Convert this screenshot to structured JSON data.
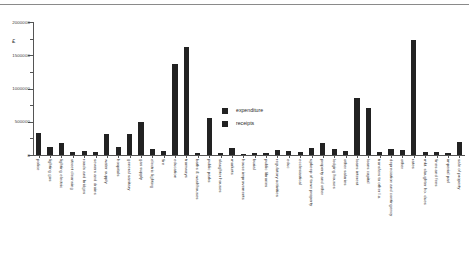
{
  "chart_data": {
    "type": "bar",
    "title": "",
    "xlabel": "",
    "ylabel": "£",
    "ylim": [
      0,
      2000000
    ],
    "ytick_labels": [
      "0",
      "500000",
      "1000000",
      "1500000",
      "2000000"
    ],
    "ytick_values": [
      0,
      500000,
      1000000,
      1500000,
      2000000
    ],
    "minor_ticks": [
      250000,
      750000,
      1250000,
      1750000
    ],
    "grid": false,
    "legend_position": "center",
    "legend": [
      "expenditure",
      "receipts"
    ],
    "categories": [
      "police",
      "lighting gas",
      "lighting electric",
      "street cleansing",
      "roads and bridges",
      "sewers and drains",
      "water supply",
      "hospitals",
      "general sanitary",
      "gas supply",
      "electric lighting",
      "fire",
      "education",
      "tramways",
      "baths & washhouses",
      "public parks",
      "slaughter houses",
      "markets",
      "house improvements",
      "burial",
      "public libraries",
      "regulatory activities",
      "educ",
      "ecclesiastical",
      "upkeep of town property",
      "property and other",
      "lodging houses",
      "other salaries",
      "loans interest",
      "loans capital",
      "transfers to other l.a.",
      "depreciation and contingency",
      "other",
      "rates",
      "mkt. slaughter ho. dues",
      "fines and fees",
      "imperial parl",
      "sale of property"
    ],
    "series": [
      {
        "name": "expenditure",
        "values": [
          330000,
          0,
          185000,
          0,
          60000,
          40000,
          310000,
          0,
          315000,
          0,
          90000,
          65000,
          1370000,
          0,
          35000,
          0,
          30000,
          0,
          20000,
          25000,
          35000,
          0,
          0,
          0,
          0,
          180000,
          0,
          60000,
          855000,
          700000,
          0,
          95000,
          75000,
          1730000,
          0,
          45000,
          0,
          200000
        ]
      },
      {
        "name": "receipts",
        "values": [
          0,
          120000,
          0,
          50000,
          0,
          0,
          0,
          120000,
          0,
          490000,
          0,
          0,
          0,
          1630000,
          0,
          550000,
          0,
          100000,
          0,
          0,
          0,
          75000,
          55000,
          40000,
          100000,
          0,
          85000,
          0,
          0,
          0,
          50000,
          0,
          0,
          0,
          50000,
          0,
          30000,
          0
        ]
      }
    ],
    "bar_values_ordered": [
      330000,
      120000,
      185000,
      50000,
      60000,
      40000,
      310000,
      120000,
      315000,
      490000,
      90000,
      65000,
      1370000,
      1630000,
      35000,
      550000,
      30000,
      100000,
      20000,
      25000,
      35000,
      75000,
      55000,
      40000,
      100000,
      180000,
      85000,
      60000,
      855000,
      700000,
      50000,
      95000,
      75000,
      1730000,
      50000,
      45000,
      30000,
      200000
    ],
    "colors": {
      "expenditure": "#222222",
      "receipts": "#222222",
      "axis": "#555555",
      "text": "#2a2a2a",
      "background": "#ffffff"
    }
  }
}
